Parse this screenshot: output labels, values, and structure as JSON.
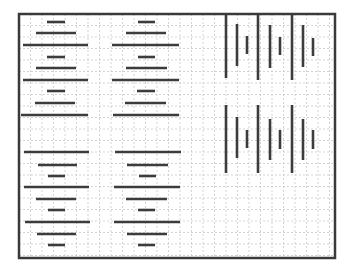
{
  "diagram": {
    "title": "",
    "frame": {
      "x": 19,
      "y": 14,
      "w": 316,
      "h": 244,
      "stroke": "#3a3a3a",
      "stroke_width": 2.5
    },
    "grid": {
      "cell": 11.5,
      "color": "#c8c8c8",
      "dash": "2,2"
    },
    "bar_color": "#3c3c3c",
    "bar_width": 2.6,
    "horizontal_bars": [
      {
        "x1": 47,
        "x2": 65,
        "y": 22
      },
      {
        "x1": 36,
        "x2": 76,
        "y": 33
      },
      {
        "x1": 23,
        "x2": 88,
        "y": 45
      },
      {
        "x1": 47,
        "x2": 65,
        "y": 57
      },
      {
        "x1": 36,
        "x2": 76,
        "y": 68
      },
      {
        "x1": 23,
        "x2": 88,
        "y": 80
      },
      {
        "x1": 47,
        "x2": 65,
        "y": 91
      },
      {
        "x1": 35,
        "x2": 75,
        "y": 103
      },
      {
        "x1": 21,
        "x2": 88,
        "y": 115
      },
      {
        "x1": 138,
        "x2": 155,
        "y": 22
      },
      {
        "x1": 126,
        "x2": 166,
        "y": 33
      },
      {
        "x1": 112,
        "x2": 179,
        "y": 45
      },
      {
        "x1": 138,
        "x2": 155,
        "y": 57
      },
      {
        "x1": 126,
        "x2": 167,
        "y": 68
      },
      {
        "x1": 112,
        "x2": 179,
        "y": 80
      },
      {
        "x1": 137,
        "x2": 155,
        "y": 91
      },
      {
        "x1": 125,
        "x2": 166,
        "y": 103
      },
      {
        "x1": 113,
        "x2": 179,
        "y": 115
      },
      {
        "x1": 24,
        "x2": 89,
        "y": 152
      },
      {
        "x1": 38,
        "x2": 77,
        "y": 165
      },
      {
        "x1": 48,
        "x2": 65,
        "y": 176
      },
      {
        "x1": 24,
        "x2": 89,
        "y": 187
      },
      {
        "x1": 36,
        "x2": 76,
        "y": 199
      },
      {
        "x1": 48,
        "x2": 65,
        "y": 210
      },
      {
        "x1": 25,
        "x2": 90,
        "y": 222
      },
      {
        "x1": 37,
        "x2": 76,
        "y": 234
      },
      {
        "x1": 48,
        "x2": 65,
        "y": 245
      },
      {
        "x1": 115,
        "x2": 181,
        "y": 152
      },
      {
        "x1": 127,
        "x2": 168,
        "y": 165
      },
      {
        "x1": 139,
        "x2": 156,
        "y": 176
      },
      {
        "x1": 114,
        "x2": 180,
        "y": 187
      },
      {
        "x1": 126,
        "x2": 167,
        "y": 199
      },
      {
        "x1": 138,
        "x2": 155,
        "y": 210
      },
      {
        "x1": 114,
        "x2": 180,
        "y": 222
      },
      {
        "x1": 127,
        "x2": 167,
        "y": 234
      },
      {
        "x1": 138,
        "x2": 155,
        "y": 245
      }
    ],
    "vertical_bars": [
      {
        "x": 226,
        "y1": 14,
        "y2": 78
      },
      {
        "x": 237,
        "y1": 24,
        "y2": 66
      },
      {
        "x": 247,
        "y1": 36,
        "y2": 54
      },
      {
        "x": 258,
        "y1": 14,
        "y2": 80
      },
      {
        "x": 270,
        "y1": 25,
        "y2": 68
      },
      {
        "x": 280,
        "y1": 37,
        "y2": 55
      },
      {
        "x": 292,
        "y1": 14,
        "y2": 80
      },
      {
        "x": 303,
        "y1": 25,
        "y2": 67
      },
      {
        "x": 313,
        "y1": 38,
        "y2": 56
      },
      {
        "x": 226,
        "y1": 105,
        "y2": 173
      },
      {
        "x": 237,
        "y1": 117,
        "y2": 158
      },
      {
        "x": 247,
        "y1": 130,
        "y2": 148
      },
      {
        "x": 258,
        "y1": 105,
        "y2": 173
      },
      {
        "x": 270,
        "y1": 119,
        "y2": 160
      },
      {
        "x": 280,
        "y1": 130,
        "y2": 149
      },
      {
        "x": 292,
        "y1": 105,
        "y2": 173
      },
      {
        "x": 303,
        "y1": 119,
        "y2": 160
      },
      {
        "x": 313,
        "y1": 130,
        "y2": 149
      }
    ]
  }
}
